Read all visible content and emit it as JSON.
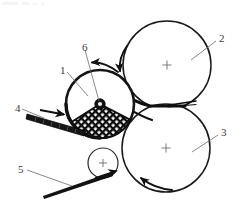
{
  "figure": {
    "type": "technical-line-drawing",
    "background_color": "#ffffff",
    "line_color": "#1a1a1a",
    "label_color": "#3a3a3a",
    "width": 245,
    "height": 208
  },
  "reference_labels": [
    {
      "id": "label-1",
      "text": "1",
      "x": 60,
      "y": 65,
      "refers_to": "mesh-forming-drum"
    },
    {
      "id": "label-2",
      "text": "2",
      "x": 219,
      "y": 33,
      "refers_to": "upper-press-roller"
    },
    {
      "id": "label-3",
      "text": "3",
      "x": 221,
      "y": 127,
      "refers_to": "lower-press-roller"
    },
    {
      "id": "label-4",
      "text": "4",
      "x": 15,
      "y": 103,
      "refers_to": "feed-blade"
    },
    {
      "id": "label-5",
      "text": "5",
      "x": 18,
      "y": 164,
      "refers_to": "outgoing-web"
    },
    {
      "id": "label-6",
      "text": "6",
      "x": 82,
      "y": 42,
      "refers_to": "center-hub"
    }
  ],
  "components": {
    "mesh_forming_drum": {
      "name": "mesh-forming-drum",
      "center_x": 100,
      "center_y": 104,
      "radius": 34,
      "rim_thickness": 2.6,
      "mesh_fill": "diamond-lattice",
      "mesh_color": "#111111"
    },
    "center_hub": {
      "name": "center-hub",
      "center_x": 100,
      "center_y": 104,
      "radius": 5
    },
    "upper_press_roller": {
      "name": "upper-press-roller",
      "center_x": 167,
      "center_y": 65,
      "radius": 44,
      "crosshair": true,
      "rotation": "clockwise"
    },
    "lower_press_roller": {
      "name": "lower-press-roller",
      "center_x": 166,
      "center_y": 148,
      "radius": 44,
      "crosshair": true,
      "rotation": "counter-clockwise"
    },
    "guide_roller": {
      "name": "guide-roller",
      "center_x": 103,
      "center_y": 163,
      "radius": 15,
      "crosshair": true
    },
    "feed_blade": {
      "name": "feed-blade",
      "from_x": 27,
      "from_y": 115,
      "to_x": 86,
      "to_y": 133,
      "flow_arrow_direction": "right"
    },
    "outgoing_web": {
      "name": "outgoing-web",
      "from_x": 43,
      "from_y": 195,
      "to_x": 114,
      "to_y": 172,
      "arrow_direction": "up-right"
    }
  },
  "rotation_arrows": [
    {
      "name": "drum-rotation-arrow",
      "position": "above-mesh-drum",
      "direction": "counter-clockwise"
    },
    {
      "name": "upper-roller-rotation-arrow",
      "position": "left-of-upper-roller",
      "direction": "clockwise"
    },
    {
      "name": "lower-roller-rotation-arrow",
      "position": "below-lower-roller",
      "direction": "counter-clockwise"
    }
  ]
}
